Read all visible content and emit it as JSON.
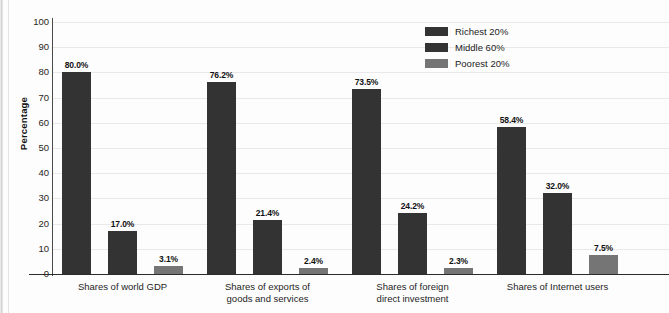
{
  "chart_data": {
    "type": "bar",
    "title": "",
    "xlabel": "",
    "ylabel": "Percentage",
    "ylim": [
      0,
      100
    ],
    "ytick_step": 10,
    "yticks": [
      0,
      10,
      20,
      30,
      40,
      50,
      60,
      70,
      80,
      90,
      100
    ],
    "grid": true,
    "legend_position": "top-right",
    "categories": [
      "Shares of world GDP",
      "Shares of exports of\ngoods and services",
      "Shares of foreign\ndirect investment",
      "Shares of Internet users"
    ],
    "series": [
      {
        "name": "Richest 20%",
        "color": "#333333",
        "values": [
          80.0,
          76.2,
          73.5,
          58.4
        ],
        "labels": [
          "80.0%",
          "76.2%",
          "73.5%",
          "58.4%"
        ]
      },
      {
        "name": "Middle 60%",
        "color": "#333333",
        "values": [
          17.0,
          21.4,
          24.2,
          32.0
        ],
        "labels": [
          "17.0%",
          "21.4%",
          "24.2%",
          "32.0%"
        ]
      },
      {
        "name": "Poorest 20%",
        "color": "#757575",
        "values": [
          3.1,
          2.4,
          2.3,
          7.5
        ],
        "labels": [
          "3.1%",
          "2.4%",
          "2.3%",
          "7.5%"
        ]
      }
    ]
  },
  "axis": {
    "y_title": "Percentage"
  },
  "legend": {
    "items": [
      {
        "label": "Richest 20%",
        "color": "#333333"
      },
      {
        "label": "Middle 60%",
        "color": "#333333"
      },
      {
        "label": "Poorest 20%",
        "color": "#757575"
      }
    ]
  }
}
